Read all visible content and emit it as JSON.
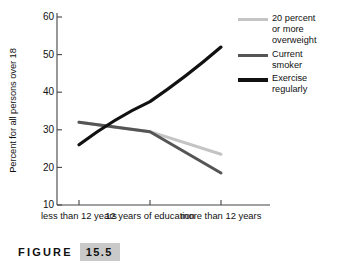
{
  "chart_data": {
    "type": "line",
    "title": "",
    "xlabel": "",
    "ylabel": "Percent for all persons over 18",
    "categories": [
      "less than\n12 years",
      "12 years\nof education",
      "more than\n12 years"
    ],
    "x": [
      0,
      1,
      2
    ],
    "ylim": [
      10,
      60
    ],
    "yticks": [
      10,
      20,
      30,
      40,
      50,
      60
    ],
    "ytick_labels": [
      "10",
      "20",
      "30",
      "40",
      "50",
      "60"
    ],
    "grid": false,
    "legend_position": "top-right",
    "series": [
      {
        "name": "20 percent\nor more\noverweight",
        "values": [
          32.0,
          29.5,
          23.5
        ],
        "color": "#c4c4c4",
        "width": 3.0
      },
      {
        "name": "Current\nsmoker",
        "values": [
          32.0,
          29.5,
          18.5
        ],
        "color": "#555555",
        "width": 3.0
      },
      {
        "name": "Exercise\nregularly",
        "values": [
          26.0,
          37.5,
          52.0
        ],
        "color": "#111111",
        "width": 3.2,
        "curved": true
      }
    ]
  },
  "axis": {
    "ylabel": "Percent for all persons over 18",
    "yticks": [
      "60",
      "50",
      "40",
      "30",
      "20",
      "10"
    ],
    "xticks": [
      "less than\n12 years",
      "12 years\nof education",
      "more than\n12 years"
    ]
  },
  "legend": {
    "items": [
      {
        "label": "20 percent\nor more\noverweight",
        "color": "#c4c4c4"
      },
      {
        "label": "Current\nsmoker",
        "color": "#555555"
      },
      {
        "label": "Exercise\nregularly",
        "color": "#111111"
      }
    ]
  },
  "caption": {
    "word": "FIGURE",
    "number": "15.5"
  },
  "colors": {
    "axis": "#444444",
    "text": "#111111",
    "caption_highlight": "#c9c9c9"
  }
}
